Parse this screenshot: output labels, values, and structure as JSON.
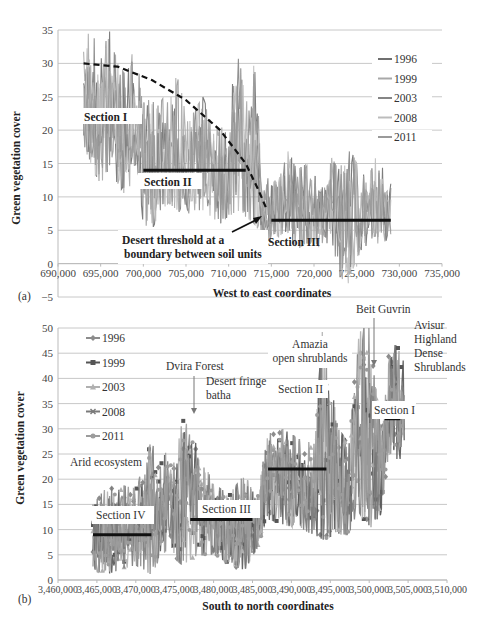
{
  "chart_data": [
    {
      "id": "a",
      "panel_label": "(a)",
      "type": "line",
      "title": "",
      "xlabel": "West to east coordinates",
      "ylabel": "Green vegetation cover",
      "xlim": [
        690000,
        735000
      ],
      "ylim": [
        -5,
        35
      ],
      "xticks": [
        690000,
        695000,
        700000,
        705000,
        710000,
        715000,
        720000,
        725000,
        730000,
        735000
      ],
      "xtick_labels": [
        "690,000",
        "695,000",
        "700,000",
        "705,000",
        "710,000",
        "715,000",
        "720,000",
        "725,000",
        "730,000",
        "735,000"
      ],
      "yticks": [
        -5,
        0,
        5,
        10,
        15,
        20,
        25,
        30,
        35
      ],
      "ytick_labels": [
        "−5",
        "0",
        "5",
        "10",
        "15",
        "20",
        "25",
        "30",
        "35"
      ],
      "grid": true,
      "legend_position": "right",
      "series": [
        {
          "name": "1996",
          "color": "#6f6f6f"
        },
        {
          "name": "1999",
          "color": "#a8a8a8"
        },
        {
          "name": "2003",
          "color": "#858585"
        },
        {
          "name": "2008",
          "color": "#bcbcbc"
        },
        {
          "name": "2011",
          "color": "#9a9a9a"
        }
      ],
      "envelope": {
        "x": [
          693000,
          694000,
          695000,
          696000,
          697000,
          698000,
          699000,
          700000,
          701000,
          702000,
          703000,
          704000,
          705000,
          706000,
          707000,
          708000,
          709000,
          710000,
          711000,
          712000,
          713000,
          714000,
          715000,
          716000,
          717000,
          718000,
          719000,
          720000,
          721000,
          722000,
          723000,
          724000,
          725000,
          726000,
          727000,
          728000,
          729000
        ],
        "high": [
          35,
          34,
          33,
          35,
          30,
          28,
          33,
          24,
          26,
          25,
          24,
          29,
          22,
          23,
          25,
          21,
          20,
          22,
          33,
          24,
          30,
          14,
          12,
          13,
          17,
          14,
          15,
          13,
          14,
          16,
          14,
          18,
          15,
          14,
          16,
          15,
          12
        ],
        "low": [
          18,
          14,
          12,
          14,
          12,
          10,
          14,
          6,
          5,
          8,
          9,
          8,
          7,
          8,
          8,
          7,
          6,
          7,
          8,
          7,
          6,
          4,
          3,
          4,
          4,
          2,
          3,
          3,
          2,
          4,
          -2,
          -3,
          1,
          2,
          3,
          3,
          4
        ]
      },
      "trend_curve": {
        "style": "dashed",
        "x": [
          693000,
          697000,
          701000,
          705000,
          709000,
          712000,
          713500,
          714500
        ],
        "y": [
          30,
          29.5,
          27.5,
          24.5,
          20,
          15,
          11,
          8
        ]
      },
      "section_lines": [
        {
          "label": "Section I",
          "x0": 693000,
          "x1": 699000,
          "y": 22
        },
        {
          "label": "Section II",
          "x0": 700000,
          "x1": 712000,
          "y": 14
        },
        {
          "label": "Section III",
          "x0": 715000,
          "x1": 729000,
          "y": 6.5
        }
      ],
      "annotations": [
        {
          "text": "Desert threshold at a boundary between soil units",
          "arrow_to": [
            714500,
            7.5
          ]
        }
      ]
    },
    {
      "id": "b",
      "panel_label": "(b)",
      "type": "line",
      "title": "",
      "xlabel": "South to north coordinates",
      "ylabel": "Green vegetation cover",
      "xlim": [
        3460000,
        3510000
      ],
      "ylim": [
        0,
        50
      ],
      "xticks": [
        3460000,
        3465000,
        3470000,
        3475000,
        3480000,
        3485000,
        3490000,
        3495000,
        3500000,
        3505000,
        3510000
      ],
      "xtick_labels": [
        "3,460,000",
        "3,465,000",
        "3,470,000",
        "3,475,000",
        "3,480,000",
        "3,485,000",
        "3,490,000",
        "3,495,000",
        "3,500,000",
        "3,505,000",
        "3,510,000"
      ],
      "yticks": [
        0,
        5,
        10,
        15,
        20,
        25,
        30,
        35,
        40,
        45,
        50
      ],
      "ytick_labels": [
        "0",
        "5",
        "10",
        "15",
        "20",
        "25",
        "30",
        "35",
        "40",
        "45",
        "50"
      ],
      "grid": true,
      "legend_position": "upper-left",
      "series": [
        {
          "name": "1996",
          "color": "#8c8c8c",
          "marker": "diamond"
        },
        {
          "name": "1999",
          "color": "#555555",
          "marker": "square"
        },
        {
          "name": "2003",
          "color": "#b0b0b0",
          "marker": "triangle"
        },
        {
          "name": "2008",
          "color": "#7a7a7a",
          "marker": "x"
        },
        {
          "name": "2011",
          "color": "#9c9c9c",
          "marker": "circle"
        }
      ],
      "envelope": {
        "x": [
          3464500,
          3466000,
          3468000,
          3470000,
          3472000,
          3473000,
          3474000,
          3475000,
          3476000,
          3477000,
          3478000,
          3480000,
          3482000,
          3484000,
          3485500,
          3487000,
          3489000,
          3491000,
          3493000,
          3494000,
          3496000,
          3497500,
          3498500,
          3500000,
          3501500,
          3502500,
          3503500,
          3504500
        ],
        "high": [
          15,
          18,
          19,
          18,
          28,
          22,
          26,
          23,
          32,
          30,
          26,
          19,
          17,
          21,
          16,
          29,
          30,
          28,
          27,
          50,
          30,
          27,
          50,
          50,
          30,
          45,
          47,
          43
        ],
        "low": [
          2,
          1,
          2,
          3,
          1,
          4,
          6,
          4,
          3,
          4,
          5,
          5,
          3,
          2,
          6,
          12,
          11,
          10,
          9,
          8,
          9,
          9,
          14,
          10,
          13,
          25,
          24,
          24
        ]
      },
      "section_lines": [
        {
          "label": "Section IV",
          "x0": 3464500,
          "x1": 3472000,
          "y": 9
        },
        {
          "label": "Section III",
          "x0": 3477000,
          "x1": 3485000,
          "y": 12
        },
        {
          "label": "Section II",
          "x0": 3487000,
          "x1": 3494500,
          "y": 22
        },
        {
          "label": "Section I",
          "x0": 3502000,
          "x1": 3504000,
          "y": 32
        }
      ],
      "annotations": [
        {
          "text": "Arid ecosystem"
        },
        {
          "text": "Dvira Forest",
          "arrow_to": [
            3476000,
            33
          ]
        },
        {
          "text": "Desert fringe batha"
        },
        {
          "text": "Amazia open shrublands"
        },
        {
          "text": "Beit Guvrin",
          "arrow_to": [
            3501000,
            35
          ]
        },
        {
          "text": "Avisur Highland Dense Shrublands"
        }
      ]
    }
  ],
  "panel_a": {
    "label": "(a)",
    "xlabel": "West to east coordinates",
    "ylabel": "Green vegetation cover",
    "legend": [
      "1996",
      "1999",
      "2003",
      "2008",
      "2011"
    ],
    "sections": [
      "Section I",
      "Section II",
      "Section III"
    ],
    "annotation_line1": "Desert threshold at a",
    "annotation_line2": "boundary between soil units"
  },
  "panel_b": {
    "label": "(b)",
    "xlabel": "South to north coordinates",
    "ylabel": "Green vegetation cover",
    "legend": [
      "1996",
      "1999",
      "2003",
      "2008",
      "2011"
    ],
    "sections": [
      "Section I",
      "Section II",
      "Section III",
      "Section IV"
    ],
    "ann_arid": "Arid ecosystem",
    "ann_dvira": "Dvira Forest",
    "ann_desert1": "Desert fringe",
    "ann_desert2": "batha",
    "ann_amazia1": "Amazia",
    "ann_amazia2": "open shrublands",
    "ann_beit": "Beit Guvrin",
    "ann_avisur1": "Avisur",
    "ann_avisur2": "Highland",
    "ann_avisur3": "Dense",
    "ann_avisur4": "Shrublands"
  }
}
